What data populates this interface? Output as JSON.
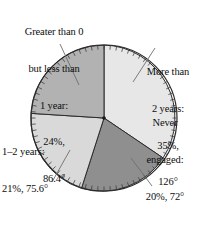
{
  "chart_data": {
    "type": "pie",
    "title": "",
    "subtitle": "",
    "xlabel": "",
    "ylabel": "",
    "legend_position": "callout-labels",
    "grid": false,
    "total_degrees": 360,
    "center": {
      "x": 104,
      "y": 118
    },
    "radius": 73,
    "start_angle_deg": 0,
    "direction": "clockwise",
    "tick_marks": {
      "count": 72,
      "every_degrees": 5,
      "style": "protractor"
    },
    "categories": [
      "More than 2 years",
      "Never engaged",
      "1–2 years",
      "Greater than 0 but less than 1 year"
    ],
    "values": [
      35,
      20,
      21,
      24
    ],
    "degrees": [
      126,
      72,
      75.6,
      86.4
    ],
    "colors": [
      "#e7e7e7",
      "#8f8f8f",
      "#d9d9d9",
      "#b2b2b2"
    ],
    "slices": [
      {
        "name": "More than 2 years",
        "percent": 35,
        "percent_text": "35%,",
        "degrees": 126,
        "degrees_text": "126°",
        "color": "#e7e7e7",
        "start_deg": 0,
        "end_deg": 126
      },
      {
        "name": "Never engaged",
        "percent": 20,
        "percent_text": "20%, 72°",
        "degrees": 72,
        "degrees_text": "72°",
        "color": "#8f8f8f",
        "start_deg": 126,
        "end_deg": 198
      },
      {
        "name": "1–2 years",
        "percent": 21,
        "percent_text": "21%, 75.6°",
        "degrees": 75.6,
        "degrees_text": "75.6°",
        "color": "#d9d9d9",
        "start_deg": 198,
        "end_deg": 273.6
      },
      {
        "name": "Greater than 0 but less than 1 year",
        "percent": 24,
        "percent_text": "24%,",
        "degrees": 86.4,
        "degrees_text": "86.4°",
        "color": "#b2b2b2",
        "start_deg": 273.6,
        "end_deg": 360
      }
    ]
  },
  "labels": {
    "top_left": {
      "line1": "Greater than 0",
      "line2": "but less than",
      "line3": "1 year:",
      "line4": "24%,",
      "line5": "86.4°"
    },
    "top_right": {
      "line1": "More than",
      "line2": "2 years:",
      "line3": "35%,",
      "line4": "126°"
    },
    "bottom_left": {
      "line1": "1–2 years:",
      "line2": "21%, 75.6°"
    },
    "bottom_right": {
      "line1": "Never",
      "line2": "engaged:",
      "line3": "20%, 72°"
    }
  },
  "style": {
    "background": "#ffffff",
    "outline": "#2b2b2b",
    "leader_line": "#6e6e6e",
    "text": "#0d0d0d"
  }
}
